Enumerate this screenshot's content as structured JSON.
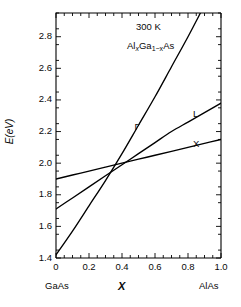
{
  "figure": {
    "background": "#ffffff",
    "line_color": "#000000",
    "axis_color": "#000000"
  },
  "annotations": {
    "temperature": "300 K",
    "material_prefix": "Al",
    "material_sub1": "x",
    "material_mid": "Ga",
    "material_sub2": "1−x",
    "material_suffix": "As",
    "material_plain": "Al(x)Ga(1-x)As"
  },
  "axes": {
    "ylabel_italic": "E",
    "ylabel_rest": "(eV)",
    "ylabel": "E(eV)",
    "xlabel": "X",
    "x_left_endpoint": "GaAs",
    "x_right_endpoint": "AlAs",
    "ytick_labels": [
      "1.4",
      "1.6",
      "1.8",
      "2.0",
      "2.2",
      "2.4",
      "2.6",
      "2.8"
    ],
    "xtick_labels": [
      "0",
      "0.2",
      "0.4",
      "0.6",
      "0.8",
      "1.0"
    ]
  },
  "curve_labels": {
    "gamma": "Γ",
    "l": "L",
    "x": "X"
  },
  "chart_data": {
    "type": "line",
    "title": "",
    "subtitle": "",
    "xlabel": "X",
    "ylabel": "E(eV)",
    "xlim": [
      0.0,
      1.0
    ],
    "ylim": [
      1.4,
      2.95
    ],
    "grid": false,
    "legend_position": "inline-curve-labels",
    "xticks": [
      0.0,
      0.2,
      0.4,
      0.6,
      0.8,
      1.0
    ],
    "yticks": [
      1.4,
      1.6,
      1.8,
      2.0,
      2.2,
      2.4,
      2.6,
      2.8
    ],
    "x_axis_endpoint_labels": {
      "left": "GaAs",
      "right": "AlAs"
    },
    "annotations": [
      "300 K",
      "Al(x)Ga(1-x)As"
    ],
    "crossover_x": 0.43,
    "crossover_energy": 1.98,
    "x": [
      0.0,
      0.1,
      0.2,
      0.3,
      0.4,
      0.5,
      0.6,
      0.7,
      0.8,
      0.9,
      1.0
    ],
    "series": [
      {
        "name": "Γ",
        "label": "Γ",
        "values": [
          1.42,
          1.57,
          1.73,
          1.89,
          2.06,
          2.24,
          2.42,
          2.61,
          2.8,
          3.0,
          3.2
        ],
        "label_x": 0.5,
        "label_y": 2.23
      },
      {
        "name": "L",
        "label": "L",
        "values": [
          1.71,
          1.78,
          1.85,
          1.92,
          1.99,
          2.06,
          2.13,
          2.2,
          2.26,
          2.32,
          2.38
        ],
        "label_x": 0.855,
        "label_y": 2.31
      },
      {
        "name": "X",
        "label": "X",
        "values": [
          1.9,
          1.925,
          1.95,
          1.975,
          2.0,
          2.025,
          2.05,
          2.075,
          2.1,
          2.125,
          2.15
        ],
        "label_x": 0.855,
        "label_y": 2.12
      }
    ]
  }
}
